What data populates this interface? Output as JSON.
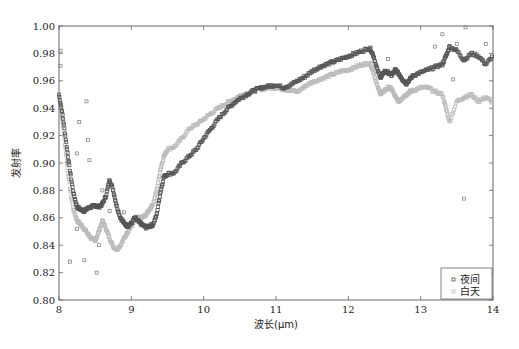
{
  "chart_data": {
    "type": "scatter",
    "title": "",
    "xlabel": "波长(μm)",
    "ylabel": "发射率",
    "xlim": [
      8,
      14
    ],
    "ylim": [
      0.8,
      1.0
    ],
    "xticks": [
      8,
      9,
      10,
      11,
      12,
      13,
      14
    ],
    "xtick_labels": [
      "8",
      "9",
      "10",
      "11",
      "12",
      "13",
      "14"
    ],
    "yticks": [
      0.8,
      0.82,
      0.84,
      0.86,
      0.88,
      0.9,
      0.92,
      0.94,
      0.96,
      0.98,
      1.0
    ],
    "ytick_labels": [
      "0.80",
      "0.82",
      "0.84",
      "0.86",
      "0.88",
      "0.90",
      "0.92",
      "0.94",
      "0.96",
      "0.98",
      "1.00"
    ],
    "grid": false,
    "legend_position": "lower right",
    "series": [
      {
        "name": "夜间",
        "color": "#555555",
        "marker": "square",
        "x": [
          8.0,
          8.05,
          8.1,
          8.15,
          8.2,
          8.25,
          8.3,
          8.35,
          8.4,
          8.45,
          8.5,
          8.55,
          8.6,
          8.65,
          8.7,
          8.75,
          8.8,
          8.85,
          8.9,
          8.95,
          9.0,
          9.05,
          9.1,
          9.15,
          9.2,
          9.25,
          9.3,
          9.35,
          9.4,
          9.45,
          9.5,
          9.6,
          9.7,
          9.8,
          9.9,
          10.0,
          10.1,
          10.2,
          10.3,
          10.4,
          10.5,
          10.6,
          10.7,
          10.8,
          10.9,
          11.0,
          11.1,
          11.2,
          11.3,
          11.4,
          11.5,
          11.6,
          11.7,
          11.8,
          11.9,
          12.0,
          12.1,
          12.2,
          12.3,
          12.35,
          12.4,
          12.45,
          12.5,
          12.55,
          12.6,
          12.65,
          12.7,
          12.75,
          12.8,
          12.85,
          12.9,
          13.0,
          13.1,
          13.2,
          13.3,
          13.35,
          13.4,
          13.5,
          13.6,
          13.7,
          13.8,
          13.9,
          14.0
        ],
        "y": [
          0.95,
          0.935,
          0.915,
          0.895,
          0.878,
          0.868,
          0.866,
          0.865,
          0.867,
          0.868,
          0.869,
          0.868,
          0.87,
          0.876,
          0.888,
          0.88,
          0.868,
          0.86,
          0.856,
          0.854,
          0.856,
          0.86,
          0.857,
          0.855,
          0.853,
          0.854,
          0.855,
          0.862,
          0.878,
          0.89,
          0.892,
          0.893,
          0.9,
          0.905,
          0.91,
          0.918,
          0.925,
          0.932,
          0.938,
          0.943,
          0.947,
          0.95,
          0.953,
          0.955,
          0.956,
          0.957,
          0.955,
          0.957,
          0.96,
          0.963,
          0.967,
          0.97,
          0.972,
          0.974,
          0.976,
          0.978,
          0.98,
          0.982,
          0.984,
          0.978,
          0.968,
          0.962,
          0.967,
          0.966,
          0.964,
          0.968,
          0.965,
          0.961,
          0.958,
          0.961,
          0.964,
          0.966,
          0.968,
          0.97,
          0.972,
          0.978,
          0.985,
          0.982,
          0.975,
          0.98,
          0.978,
          0.972,
          0.978
        ]
      },
      {
        "name": "白天",
        "color": "#bbbbbb",
        "marker": "square",
        "x": [
          8.0,
          8.05,
          8.1,
          8.15,
          8.2,
          8.25,
          8.3,
          8.35,
          8.4,
          8.45,
          8.5,
          8.55,
          8.6,
          8.65,
          8.7,
          8.75,
          8.8,
          8.85,
          8.9,
          8.95,
          9.0,
          9.05,
          9.1,
          9.15,
          9.2,
          9.25,
          9.3,
          9.35,
          9.4,
          9.45,
          9.5,
          9.6,
          9.7,
          9.8,
          9.9,
          10.0,
          10.1,
          10.2,
          10.3,
          10.4,
          10.5,
          10.6,
          10.7,
          10.8,
          10.9,
          11.0,
          11.1,
          11.2,
          11.3,
          11.4,
          11.5,
          11.6,
          11.7,
          11.8,
          11.9,
          12.0,
          12.1,
          12.2,
          12.3,
          12.35,
          12.4,
          12.45,
          12.5,
          12.55,
          12.6,
          12.65,
          12.7,
          12.75,
          12.8,
          12.85,
          12.9,
          13.0,
          13.1,
          13.2,
          13.3,
          13.35,
          13.4,
          13.5,
          13.6,
          13.7,
          13.8,
          13.9,
          14.0
        ],
        "y": [
          0.948,
          0.93,
          0.905,
          0.882,
          0.866,
          0.858,
          0.855,
          0.852,
          0.848,
          0.845,
          0.843,
          0.85,
          0.858,
          0.852,
          0.845,
          0.839,
          0.837,
          0.84,
          0.845,
          0.85,
          0.854,
          0.858,
          0.86,
          0.86,
          0.862,
          0.866,
          0.87,
          0.88,
          0.895,
          0.905,
          0.91,
          0.912,
          0.918,
          0.925,
          0.928,
          0.932,
          0.936,
          0.94,
          0.943,
          0.946,
          0.949,
          0.951,
          0.953,
          0.954,
          0.955,
          0.955,
          0.954,
          0.953,
          0.952,
          0.956,
          0.959,
          0.961,
          0.963,
          0.965,
          0.967,
          0.968,
          0.97,
          0.972,
          0.973,
          0.966,
          0.956,
          0.95,
          0.953,
          0.955,
          0.954,
          0.948,
          0.945,
          0.948,
          0.95,
          0.952,
          0.953,
          0.955,
          0.955,
          0.952,
          0.95,
          0.94,
          0.93,
          0.945,
          0.948,
          0.95,
          0.945,
          0.948,
          0.944
        ]
      }
    ],
    "outliers_night": [
      {
        "x": 8.02,
        "y": 0.982
      },
      {
        "x": 8.02,
        "y": 0.971
      },
      {
        "x": 8.38,
        "y": 0.945
      },
      {
        "x": 8.28,
        "y": 0.93
      },
      {
        "x": 8.4,
        "y": 0.917
      },
      {
        "x": 8.25,
        "y": 0.907
      },
      {
        "x": 8.12,
        "y": 0.9
      },
      {
        "x": 8.42,
        "y": 0.902
      },
      {
        "x": 8.6,
        "y": 0.88
      },
      {
        "x": 8.7,
        "y": 0.865
      },
      {
        "x": 8.25,
        "y": 0.852
      },
      {
        "x": 8.15,
        "y": 0.828
      },
      {
        "x": 8.35,
        "y": 0.829
      },
      {
        "x": 8.52,
        "y": 0.82
      },
      {
        "x": 8.55,
        "y": 0.84
      },
      {
        "x": 8.9,
        "y": 0.864
      },
      {
        "x": 12.55,
        "y": 0.976
      },
      {
        "x": 13.2,
        "y": 0.985
      },
      {
        "x": 13.3,
        "y": 0.994
      },
      {
        "x": 13.5,
        "y": 0.987
      },
      {
        "x": 13.62,
        "y": 0.999
      },
      {
        "x": 13.9,
        "y": 0.987
      },
      {
        "x": 13.45,
        "y": 0.961
      },
      {
        "x": 13.6,
        "y": 0.874
      }
    ]
  },
  "legend": {
    "items": [
      {
        "label": "夜间",
        "color": "#555555"
      },
      {
        "label": "白天",
        "color": "#bbbbbb"
      }
    ]
  }
}
